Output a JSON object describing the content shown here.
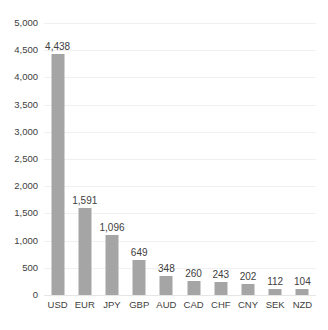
{
  "chart_data": {
    "type": "bar",
    "title": "",
    "subtitle": "",
    "xlabel": "",
    "ylabel": "",
    "categories": [
      "USD",
      "EUR",
      "JPY",
      "GBP",
      "AUD",
      "CAD",
      "CHF",
      "CNY",
      "SEK",
      "NZD"
    ],
    "values": [
      4438,
      1591,
      1096,
      649,
      348,
      260,
      243,
      202,
      112,
      104
    ],
    "value_labels": [
      "4,438",
      "1,591",
      "1,096",
      "649",
      "348",
      "260",
      "243",
      "202",
      "112",
      "104"
    ],
    "ylim": [
      0,
      5000
    ],
    "ytick_values": [
      0,
      500,
      1000,
      1500,
      2000,
      2500,
      3000,
      3500,
      4000,
      4500,
      5000
    ],
    "ytick_labels": [
      "0",
      "500",
      "1,000",
      "1,500",
      "2,000",
      "2,500",
      "3,000",
      "3,500",
      "4,000",
      "4,500",
      "5,000"
    ],
    "grid": true,
    "legend": false,
    "legend_position": "none",
    "annotations": [],
    "colors": {
      "bar": "#a5a5a5",
      "gridline": "#f0f0f0",
      "baseline": "#e6e6e6",
      "text": "#404040",
      "background": "#ffffff"
    }
  }
}
